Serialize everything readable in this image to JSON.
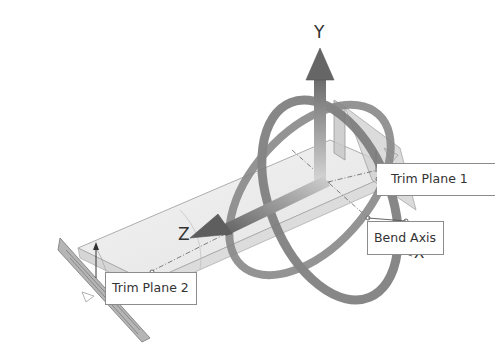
{
  "diagram": {
    "axes": {
      "y": "Y",
      "z": "Z",
      "x": "X"
    },
    "callouts": {
      "trim_plane_1": "Trim Plane 1",
      "trim_plane_2": "Trim Plane 2",
      "bend_axis": "Bend Axis"
    },
    "colors": {
      "background": "#ffffff",
      "ring": "#7a7a7a",
      "arrow": "#6e6e6e",
      "plane_fill": "#b5b5b5",
      "body_fill": "#ebebeb",
      "edge": "#8c8c8c",
      "callout_border": "#8c8c8c",
      "text": "#333333"
    }
  }
}
